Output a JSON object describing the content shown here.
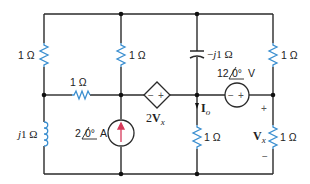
{
  "diagram": {
    "type": "ac-circuit",
    "components": {
      "r_left_top": {
        "label": "1 Ω"
      },
      "r_mid_top": {
        "label": "1 Ω"
      },
      "r_horizontal": {
        "label": "1 Ω"
      },
      "inductor": {
        "label_j": "j",
        "label": "1 Ω"
      },
      "current_source": {
        "label": "2",
        "angle": "0°",
        "unit": "A"
      },
      "dependent_source": {
        "coef": "2",
        "var": "V",
        "sub": "x",
        "plus": "+",
        "minus": "−"
      },
      "capacitor": {
        "label_pre": "−",
        "label_j": "j",
        "label": "1 Ω"
      },
      "r_right_top": {
        "label": "1 Ω"
      },
      "voltage_source": {
        "label": "12",
        "angle": "0°",
        "unit": "V",
        "plus": "+",
        "minus": "−"
      },
      "r_io": {
        "label": "1 Ω"
      },
      "io_label": {
        "var": "I",
        "sub": "o"
      },
      "r_vx": {
        "label": "1 Ω"
      },
      "vx_label": {
        "var": "V",
        "sub": "x",
        "plus": "+",
        "minus": "−"
      }
    },
    "colors": {
      "wire": "#2a2a2a",
      "resistor": "#3b8fd0",
      "arrow": "#d63a5a"
    }
  }
}
